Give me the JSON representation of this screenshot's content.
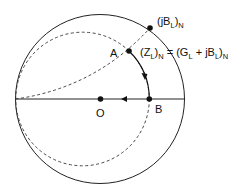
{
  "diagram": {
    "type": "smith-chart-admittance",
    "points": {
      "jBN": {
        "label_main": "(jB",
        "label_sub1": "L",
        "label_close": ")",
        "label_sub2": "N"
      },
      "A": {
        "label": "A"
      },
      "B": {
        "label": "B"
      },
      "O": {
        "label": "O"
      }
    },
    "equation": {
      "lhs_open": "(Z",
      "lhs_sub1": "L",
      "lhs_close": ")",
      "lhs_sub2": "N",
      "eq": " = (G",
      "rhs_sub1": "L",
      "rhs_mid": " + jB",
      "rhs_sub2": "L",
      "rhs_close": ")",
      "rhs_sub3": "N"
    },
    "colors": {
      "line": "#111111",
      "background": "#ffffff"
    }
  }
}
